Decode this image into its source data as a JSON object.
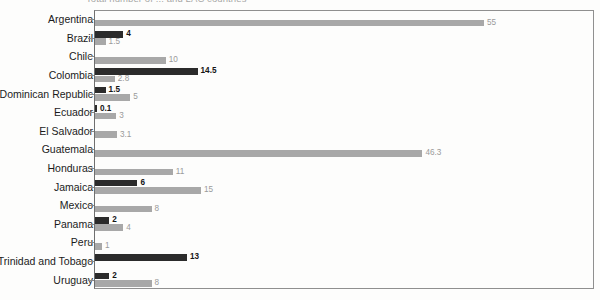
{
  "chart": {
    "title_clipped": "Total number of ... and LAC countries",
    "axis": {
      "x_min": 0,
      "x_max": 70,
      "grid": false,
      "frame": true
    },
    "colors": {
      "series_dark": "#2b2b2b",
      "series_light": "#a8a8a8",
      "frame": "#8f8f8f",
      "label_text": "#1b1b1b",
      "dark_value_text": "#151515",
      "light_value_text": "#9a9a9a"
    }
  },
  "chart_data": {
    "type": "bar",
    "orientation": "horizontal",
    "title": "",
    "xlabel": "",
    "ylabel": "",
    "xlim": [
      0,
      70
    ],
    "grid": false,
    "legend": "none",
    "categories": [
      "Argentina",
      "Brazil",
      "Chile",
      "Colombia",
      "Dominican Republic",
      "Ecuador",
      "El Salvador",
      "Guatemala",
      "Honduras",
      "Jamaica",
      "Mexico",
      "Panama",
      "Peru",
      "Trinidad and Tobago",
      "Uruguay"
    ],
    "series": [
      {
        "name": "dark",
        "color": "#2b2b2b",
        "values": [
          null,
          4,
          null,
          14.5,
          1.5,
          0.1,
          null,
          null,
          null,
          6,
          null,
          2,
          null,
          13,
          2
        ]
      },
      {
        "name": "light",
        "color": "#a8a8a8",
        "values": [
          55,
          1.5,
          10,
          2.8,
          5,
          3,
          3.1,
          46.3,
          11,
          15,
          8,
          4,
          1,
          null,
          8
        ]
      }
    ]
  },
  "rows": [
    {
      "label": "Argentina",
      "dark": null,
      "dark_text": "",
      "light": 55,
      "light_text": "55"
    },
    {
      "label": "Brazil",
      "dark": 4,
      "dark_text": "4",
      "light": 1.5,
      "light_text": "1.5"
    },
    {
      "label": "Chile",
      "dark": null,
      "dark_text": "",
      "light": 10,
      "light_text": "10"
    },
    {
      "label": "Colombia",
      "dark": 14.5,
      "dark_text": "14.5",
      "light": 2.8,
      "light_text": "2.8"
    },
    {
      "label": "Dominican Republic",
      "dark": 1.5,
      "dark_text": "1.5",
      "light": 5,
      "light_text": "5"
    },
    {
      "label": "Ecuador",
      "dark": 0.1,
      "dark_text": "0.1",
      "light": 3,
      "light_text": "3"
    },
    {
      "label": "El Salvador",
      "dark": null,
      "dark_text": "",
      "light": 3.1,
      "light_text": "3.1"
    },
    {
      "label": "Guatemala",
      "dark": null,
      "dark_text": "",
      "light": 46.3,
      "light_text": "46.3"
    },
    {
      "label": "Honduras",
      "dark": null,
      "dark_text": "",
      "light": 11,
      "light_text": "11"
    },
    {
      "label": "Jamaica",
      "dark": 6,
      "dark_text": "6",
      "light": 15,
      "light_text": "15"
    },
    {
      "label": "Mexico",
      "dark": null,
      "dark_text": "",
      "light": 8,
      "light_text": "8"
    },
    {
      "label": "Panama",
      "dark": 2,
      "dark_text": "2",
      "light": 4,
      "light_text": "4"
    },
    {
      "label": "Peru",
      "dark": null,
      "dark_text": "",
      "light": 1,
      "light_text": "1"
    },
    {
      "label": "Trinidad and Tobago",
      "dark": 13,
      "dark_text": "13",
      "light": null,
      "light_text": ""
    },
    {
      "label": "Uruguay",
      "dark": 2,
      "dark_text": "2",
      "light": 8,
      "light_text": "8"
    }
  ]
}
